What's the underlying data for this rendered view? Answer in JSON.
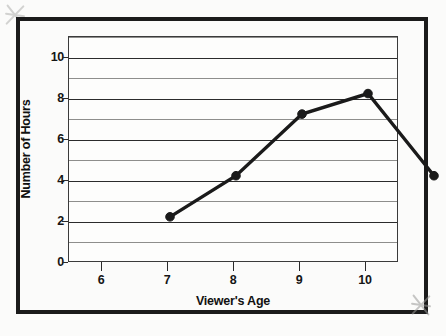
{
  "figure": {
    "background_color": "#fbfbfa",
    "frame_color": "#1b1b1b",
    "plot_background_color": "#fdfdfc"
  },
  "chart_data": {
    "type": "line",
    "title": "",
    "xlabel": "Viewer's Age",
    "ylabel": "Number of Hours",
    "x": [
      6,
      7,
      8,
      9,
      10
    ],
    "values": [
      4,
      6,
      9,
      10,
      6
    ],
    "series": [
      {
        "name": "Number of Hours",
        "values": [
          4,
          6,
          9,
          10,
          6
        ],
        "color": "#1a1a1a",
        "marker": "circle",
        "line_width": 3
      }
    ],
    "xlim": [
      5.5,
      10.5
    ],
    "ylim": [
      0,
      11
    ],
    "xticks": [
      6,
      7,
      8,
      9,
      10
    ],
    "xtick_labels": [
      "6",
      "7",
      "8",
      "9",
      "10"
    ],
    "yticks": [
      0,
      2,
      4,
      6,
      8,
      10
    ],
    "ytick_labels": [
      "0",
      "2",
      "4",
      "6",
      "8",
      "10"
    ],
    "y_gridlines_major": [
      0,
      2,
      4,
      6,
      8,
      10
    ],
    "y_gridlines_minor": [
      1,
      3,
      5,
      7,
      9,
      11
    ],
    "grid": true,
    "grid_axis": "y",
    "legend": false,
    "legend_position": "none",
    "annotations": [],
    "data_points": [
      {
        "x": 6,
        "y": 4,
        "label": "6, 4"
      },
      {
        "x": 7,
        "y": 6,
        "label": "7, 6"
      },
      {
        "x": 8,
        "y": 9,
        "label": "8, 9"
      },
      {
        "x": 9,
        "y": 10,
        "label": "9, 10"
      },
      {
        "x": 10,
        "y": 6,
        "label": "10, 6"
      }
    ]
  }
}
